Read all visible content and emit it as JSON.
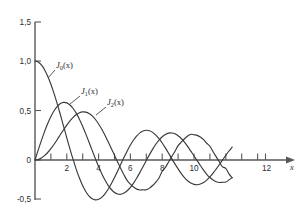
{
  "chart_data": {
    "type": "line",
    "title": "",
    "xlabel": "x",
    "ylabel": "",
    "xlim": [
      0,
      12.6
    ],
    "ylim": [
      -0.5,
      1.5
    ],
    "grid": false,
    "legend_position": "inline-annotations",
    "x_ticks": [
      0,
      1,
      2,
      3,
      4,
      5,
      6,
      7,
      8,
      9,
      10,
      11,
      12
    ],
    "x_tick_labels": [
      "",
      "",
      "2",
      "",
      "4",
      "",
      "6",
      "",
      "8",
      "",
      "10",
      "",
      "12"
    ],
    "y_ticks": [
      -0.5,
      0,
      0.5,
      1.0,
      1.5
    ],
    "y_tick_labels": [
      "-0,5",
      "0",
      "0,5",
      "1,0",
      "1,5"
    ],
    "decimal_separator": ",",
    "series": [
      {
        "name": "J_0(x)",
        "label_text": "J",
        "label_subscript": "0",
        "label_arg": "(x)",
        "color": "#3a3a3c",
        "x": [
          0,
          0.2,
          0.4,
          0.6,
          0.8,
          1.0,
          1.2,
          1.4,
          1.6,
          1.8,
          2.0,
          2.2,
          2.4,
          2.6,
          2.8,
          3.0,
          3.2,
          3.4,
          3.6,
          3.8,
          4.0,
          4.2,
          4.4,
          4.6,
          4.8,
          5.0,
          5.2,
          5.4,
          5.6,
          5.8,
          6.0,
          6.2,
          6.4,
          6.6,
          6.8,
          7.0,
          7.2,
          7.4,
          7.6,
          7.8,
          8.0,
          8.2,
          8.4,
          8.6,
          8.8,
          9.0,
          9.2,
          9.4,
          9.6,
          9.8,
          10.0,
          10.2,
          10.4,
          10.6,
          10.8,
          11.0,
          11.2,
          11.4,
          11.6,
          11.8,
          12.0,
          12.2,
          12.4
        ],
        "y": [
          1.0,
          0.99,
          0.96,
          0.912,
          0.846,
          0.765,
          0.671,
          0.567,
          0.455,
          0.34,
          0.224,
          0.11,
          0.003,
          -0.097,
          -0.185,
          -0.26,
          -0.32,
          -0.364,
          -0.392,
          -0.403,
          -0.397,
          -0.377,
          -0.342,
          -0.296,
          -0.24,
          -0.178,
          -0.11,
          -0.041,
          0.027,
          0.092,
          0.151,
          0.202,
          0.243,
          0.274,
          0.293,
          0.3,
          0.295,
          0.279,
          0.252,
          0.215,
          0.172,
          0.122,
          0.069,
          0.014,
          -0.039,
          -0.09,
          -0.137,
          -0.177,
          -0.209,
          -0.232,
          -0.246,
          -0.25,
          -0.243,
          -0.228,
          -0.203,
          -0.171,
          -0.133,
          -0.09,
          -0.045,
          0.001,
          0.047,
          0.091,
          0.131
        ]
      },
      {
        "name": "J_1(x)",
        "label_text": "J",
        "label_subscript": "1",
        "label_arg": "(x)",
        "color": "#3a3a3c",
        "x": [
          0,
          0.2,
          0.4,
          0.6,
          0.8,
          1.0,
          1.2,
          1.4,
          1.6,
          1.8,
          2.0,
          2.2,
          2.4,
          2.6,
          2.8,
          3.0,
          3.2,
          3.4,
          3.6,
          3.8,
          4.0,
          4.2,
          4.4,
          4.6,
          4.8,
          5.0,
          5.2,
          5.4,
          5.6,
          5.8,
          6.0,
          6.2,
          6.4,
          6.6,
          6.8,
          7.0,
          7.2,
          7.4,
          7.6,
          7.8,
          8.0,
          8.2,
          8.4,
          8.6,
          8.8,
          9.0,
          9.2,
          9.4,
          9.6,
          9.8,
          10.0,
          10.2,
          10.4,
          10.6,
          10.8,
          11.0,
          11.2,
          11.4,
          11.6,
          11.8,
          12.0,
          12.2,
          12.4
        ],
        "y": [
          0.0,
          0.0995,
          0.196,
          0.287,
          0.369,
          0.44,
          0.498,
          0.542,
          0.57,
          0.582,
          0.577,
          0.556,
          0.52,
          0.471,
          0.41,
          0.339,
          0.261,
          0.179,
          0.095,
          0.013,
          -0.066,
          -0.139,
          -0.203,
          -0.257,
          -0.298,
          -0.328,
          -0.343,
          -0.346,
          -0.334,
          -0.311,
          -0.277,
          -0.233,
          -0.182,
          -0.125,
          -0.065,
          -0.005,
          0.054,
          0.11,
          0.159,
          0.201,
          0.235,
          0.258,
          0.271,
          0.273,
          0.265,
          0.245,
          0.217,
          0.18,
          0.137,
          0.089,
          0.043,
          -0.007,
          -0.056,
          -0.102,
          -0.144,
          -0.177,
          -0.202,
          -0.219,
          -0.227,
          -0.225,
          -0.223,
          -0.201,
          -0.177
        ]
      },
      {
        "name": "J_2(x)",
        "label_text": "J",
        "label_subscript": "2",
        "label_arg": "(x)",
        "color": "#3a3a3c",
        "x": [
          0,
          0.2,
          0.4,
          0.6,
          0.8,
          1.0,
          1.2,
          1.4,
          1.6,
          1.8,
          2.0,
          2.2,
          2.4,
          2.6,
          2.8,
          3.0,
          3.2,
          3.4,
          3.6,
          3.8,
          4.0,
          4.2,
          4.4,
          4.6,
          4.8,
          5.0,
          5.2,
          5.4,
          5.6,
          5.8,
          6.0,
          6.2,
          6.4,
          6.6,
          6.8,
          7.0,
          7.2,
          7.4,
          7.6,
          7.8,
          8.0,
          8.2,
          8.4,
          8.6,
          8.8,
          9.0,
          9.2,
          9.4,
          9.6,
          9.8,
          10.0,
          10.2,
          10.4,
          10.6,
          10.8,
          11.0,
          11.2,
          11.4,
          11.6,
          11.8,
          12.0,
          12.2,
          12.4
        ],
        "y": [
          0.0,
          0.005,
          0.0197,
          0.0437,
          0.0758,
          0.115,
          0.159,
          0.207,
          0.257,
          0.306,
          0.353,
          0.395,
          0.431,
          0.459,
          0.478,
          0.486,
          0.484,
          0.47,
          0.445,
          0.409,
          0.364,
          0.311,
          0.25,
          0.185,
          0.117,
          0.047,
          -0.022,
          -0.089,
          -0.151,
          -0.208,
          -0.243,
          -0.273,
          -0.294,
          -0.303,
          -0.301,
          -0.301,
          -0.284,
          -0.258,
          -0.223,
          -0.181,
          -0.113,
          -0.074,
          -0.02,
          0.034,
          0.086,
          0.145,
          0.18,
          0.215,
          0.242,
          0.26,
          0.255,
          0.249,
          0.232,
          0.205,
          0.169,
          0.139,
          0.084,
          0.032,
          -0.02,
          -0.07,
          -0.085,
          -0.14,
          -0.18
        ]
      }
    ],
    "annotations": [
      {
        "text": "J0(x)",
        "target_series": "J_0(x)"
      },
      {
        "text": "J1(x)",
        "target_series": "J_1(x)"
      },
      {
        "text": "J2(x)",
        "target_series": "J_2(x)"
      }
    ]
  },
  "axes": {
    "x_axis_label": "x",
    "y_tick_0": "1,5",
    "y_tick_1": "1,0",
    "y_tick_2": "0,5",
    "y_tick_3": "0",
    "y_tick_4": "-0,5",
    "x_tick_2": "2",
    "x_tick_4": "4",
    "x_tick_6": "6",
    "x_tick_8": "8",
    "x_tick_10": "10",
    "x_tick_12": "12"
  },
  "labels": {
    "j0": {
      "base": "J",
      "sub": "0",
      "arg": "(x)"
    },
    "j1": {
      "base": "J",
      "sub": "1",
      "arg": "(x)"
    },
    "j2": {
      "base": "J",
      "sub": "2",
      "arg": "(x)"
    }
  },
  "style": {
    "background": "#ffffff",
    "axis_color": "#58585a",
    "curve_color": "#3a3a3c",
    "text_color": "#2e2e30"
  }
}
